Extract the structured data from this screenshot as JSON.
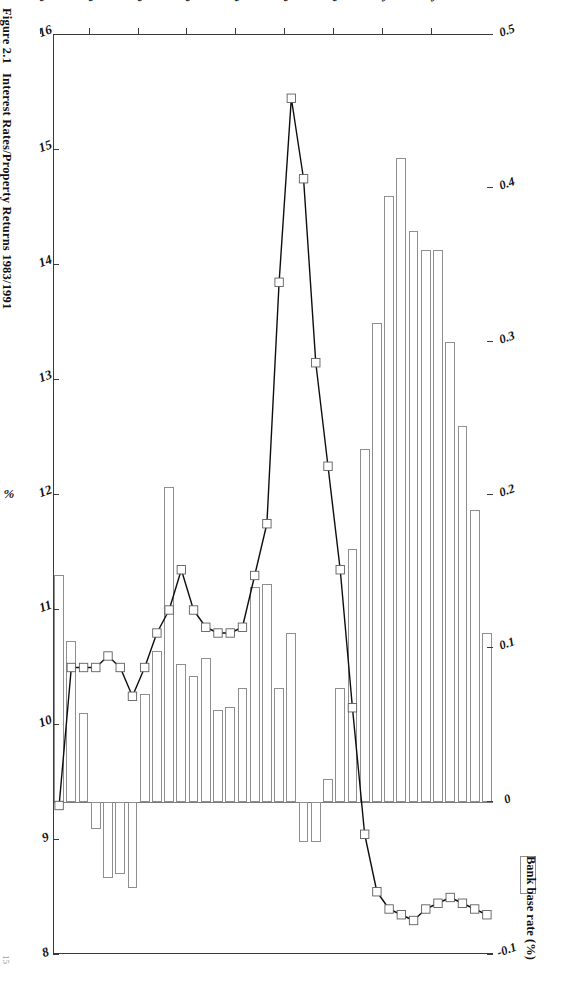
{
  "figure": {
    "number": "Figure 2.1",
    "title": "Interest Rates/Property Returns 1983/1991",
    "page_number": "15"
  },
  "legend": {
    "entries": [
      {
        "label": "Bank base rate (%)",
        "swatch": "white-rectangle-outline"
      }
    ]
  },
  "axes": {
    "category": {
      "title": "YEAR (QUARTERS)",
      "ticks": [
        "'83",
        "'84",
        "'85",
        "'86",
        "'87",
        "'88",
        "'89",
        "'90",
        "'91"
      ]
    },
    "primary_value": {
      "title": "%",
      "ticks": [
        "16",
        "15",
        "14",
        "13",
        "12",
        "11",
        "10",
        "9",
        "8"
      ],
      "min": 8,
      "max": 16
    },
    "secondary_value": {
      "title": "",
      "ticks": [
        "0.5",
        "0.4",
        "0.3",
        "0.2",
        "0.1",
        "0",
        "-0.1"
      ],
      "min": -0.1,
      "max": 0.5
    }
  },
  "chart_data": {
    "type": "bar",
    "title": "Interest Rates/Property Returns 1983/1991",
    "subtitle": "Figure 2.1",
    "xlabel": "YEAR (QUARTERS)",
    "ylabel": "%",
    "y2label": "",
    "ylim": [
      8,
      16
    ],
    "y2lim": [
      -0.1,
      0.5
    ],
    "grid": false,
    "legend_position": "bottom-right",
    "orientation": "rotated-90",
    "categories": [
      "'83 Q1",
      "'83 Q2",
      "'83 Q3",
      "'83 Q4",
      "'84 Q1",
      "'84 Q2",
      "'84 Q3",
      "'84 Q4",
      "'85 Q1",
      "'85 Q2",
      "'85 Q3",
      "'85 Q4",
      "'86 Q1",
      "'86 Q2",
      "'86 Q3",
      "'86 Q4",
      "'87 Q1",
      "'87 Q2",
      "'87 Q3",
      "'87 Q4",
      "'88 Q1",
      "'88 Q2",
      "'88 Q3",
      "'88 Q4",
      "'89 Q1",
      "'89 Q2",
      "'89 Q3",
      "'89 Q4",
      "'90 Q1",
      "'90 Q2",
      "'90 Q3",
      "'90 Q4",
      "'91 Q1",
      "'91 Q2",
      "'91 Q3",
      "'91 Q4"
    ],
    "series": [
      {
        "name": "Property returns",
        "type": "bar",
        "axis": "secondary",
        "values": [
          0.148,
          0.105,
          0.058,
          -0.018,
          -0.05,
          -0.047,
          -0.056,
          0.07,
          0.098,
          0.205,
          0.09,
          0.082,
          0.094,
          0.06,
          0.062,
          0.074,
          0.14,
          0.142,
          0.074,
          0.11,
          -0.026,
          -0.026,
          0.015,
          0.074,
          0.165,
          0.23,
          0.312,
          0.395,
          0.42,
          0.372,
          0.36,
          0.36,
          0.3,
          0.245,
          0.19,
          0.11
        ]
      },
      {
        "name": "Bank base rate (%)",
        "type": "line",
        "axis": "primary",
        "marker": "square",
        "values": [
          9.3,
          10.5,
          10.5,
          10.5,
          10.6,
          10.5,
          10.25,
          10.5,
          10.8,
          11.0,
          11.35,
          11.0,
          10.85,
          10.8,
          10.8,
          10.85,
          11.3,
          11.75,
          13.85,
          15.45,
          14.75,
          13.15,
          12.25,
          11.35,
          10.15,
          9.05,
          8.55,
          8.4,
          8.35,
          8.3,
          8.4,
          8.45,
          8.5,
          8.45,
          8.4,
          8.35
        ]
      }
    ]
  }
}
